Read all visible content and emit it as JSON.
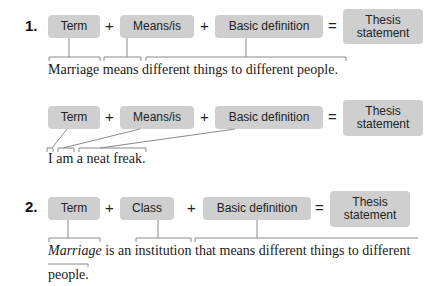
{
  "examples": [
    {
      "number": "1.",
      "formula": {
        "term": "Term",
        "plus1": "+",
        "middle": "Means/is",
        "plus2": "+",
        "definition": "Basic definition",
        "equals": "=",
        "result": [
          "Thesis",
          "statement"
        ]
      },
      "sentence": "Marriage means different things to different people."
    },
    {
      "number": "",
      "formula": {
        "term": "Term",
        "plus1": "+",
        "middle": "Means/is",
        "plus2": "+",
        "definition": "Basic definition",
        "equals": "=",
        "result": [
          "Thesis",
          "statement"
        ]
      },
      "sentence": "I am a neat freak."
    },
    {
      "number": "2.",
      "formula": {
        "term": "Term",
        "plus1": "+",
        "middle": "Class",
        "plus2": "+",
        "definition": "Basic definition",
        "equals": "=",
        "result": [
          "Thesis",
          "statement"
        ]
      },
      "sentence_italic": "Marriage",
      "sentence_rest": " is an institution that means different things to different",
      "sentence_line2": "people."
    }
  ]
}
